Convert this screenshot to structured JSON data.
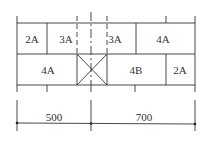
{
  "diagram": {
    "top_row": [
      {
        "label": "2A",
        "x": 32,
        "y": 39
      },
      {
        "label": "3A",
        "x": 66,
        "y": 39
      },
      {
        "label": "3A",
        "x": 115,
        "y": 39
      },
      {
        "label": "4A",
        "x": 163,
        "y": 39
      }
    ],
    "bottom_row": [
      {
        "label": "4A",
        "x": 48,
        "y": 70
      },
      {
        "label": "4B",
        "x": 136,
        "y": 70
      },
      {
        "label": "2A",
        "x": 180,
        "y": 70
      }
    ],
    "dimensions": [
      {
        "label": "500",
        "x": 54,
        "y": 117
      },
      {
        "label": "700",
        "x": 144,
        "y": 117
      }
    ],
    "line_color": "#333333"
  }
}
